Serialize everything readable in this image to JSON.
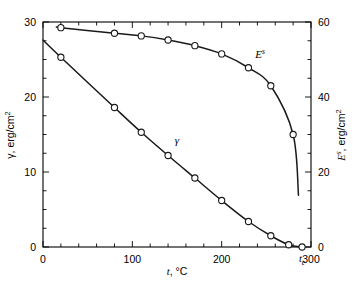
{
  "chart_data": {
    "type": "line",
    "title": "",
    "xlabel": "t, °C",
    "ylabel": "γ, erg/cm²",
    "y2label": "Eˢ, erg/cm²",
    "xlim": [
      0,
      300
    ],
    "ylim": [
      0,
      30
    ],
    "y2lim": [
      0,
      60
    ],
    "grid": false,
    "legend_position": "inline-annotation",
    "x_ticks": [
      0,
      100,
      200,
      300
    ],
    "x_ticklabels": [
      "0",
      "100",
      "200",
      "300"
    ],
    "x_minor_step": 20,
    "y_ticks": [
      0,
      10,
      20,
      30
    ],
    "y_ticklabels": [
      "0",
      "10",
      "20",
      "30"
    ],
    "y_minor_step": 2.5,
    "y2_ticks": [
      0,
      20,
      40,
      60
    ],
    "y2_ticklabels": [
      "0",
      "20",
      "40",
      "60"
    ],
    "y2_minor_step": 5,
    "annotations": [
      {
        "name": "critical-temperature",
        "text": "t",
        "sub": "c",
        "x": 290,
        "axis": "x"
      },
      {
        "name": "gamma-curve-label",
        "text": "γ",
        "x": 150,
        "y": 13.7
      },
      {
        "name": "es-curve-label",
        "text": "E",
        "sup": "s",
        "x": 243,
        "y2": 50.5
      }
    ],
    "series": [
      {
        "name": "γ",
        "label": "gamma",
        "axis": "left",
        "units": "erg/cm²",
        "x": [
          20,
          80,
          110,
          140,
          170,
          200,
          230,
          255,
          275,
          290
        ],
        "values": [
          25.3,
          18.6,
          15.3,
          12.2,
          9.2,
          6.2,
          3.4,
          1.5,
          0.3,
          0.0
        ],
        "curve_start": {
          "x": 0,
          "y": 27.6
        },
        "curve_end": {
          "x": 290,
          "y": 0.0
        }
      },
      {
        "name": "Eˢ",
        "label": "surface-energy",
        "axis": "right",
        "units": "erg/cm²",
        "x": [
          20,
          80,
          110,
          140,
          170,
          200,
          230,
          255,
          280
        ],
        "values": [
          58.5,
          57.0,
          56.3,
          55.2,
          53.7,
          51.5,
          47.8,
          43.0,
          30.0
        ],
        "curve_start": {
          "x": 18,
          "y2": 58.6
        },
        "curve_end": {
          "x": 286,
          "y2": 13.8
        }
      }
    ]
  },
  "axes": {
    "left": {
      "title_text": "γ, erg/cm",
      "title_sup": "2",
      "ticklabels": [
        "30",
        "20",
        "10",
        "0"
      ]
    },
    "right": {
      "title_base": "E",
      "title_sup_s": "s",
      "title_rest": ", erg/cm",
      "title_sup_2": "2",
      "ticklabels": [
        "60",
        "40",
        "20",
        "0"
      ]
    },
    "bottom": {
      "title_base": "t",
      "title_rest": ", °C",
      "ticklabels": [
        "0",
        "100",
        "200",
        "300"
      ],
      "tc_base": "t",
      "tc_sub": "c"
    }
  },
  "series_labels": {
    "gamma": "γ",
    "es_base": "E",
    "es_sup": "s"
  }
}
